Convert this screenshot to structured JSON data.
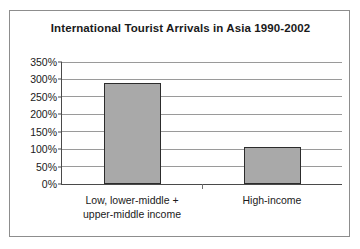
{
  "chart_data": {
    "type": "bar",
    "title": "International Tourist Arrivals in Asia 1990-2002",
    "xlabel": "",
    "ylabel": "",
    "categories": [
      "Low, lower-middle + upper-middle income",
      "High-income"
    ],
    "category_lines": [
      [
        "Low, lower-middle +",
        "upper-middle income"
      ],
      [
        "High-income"
      ]
    ],
    "values": [
      290,
      105
    ],
    "value_labels": [
      "290%",
      "105%"
    ],
    "ylim": [
      0,
      350
    ],
    "ytick_values": [
      0,
      50,
      100,
      150,
      200,
      250,
      300,
      350
    ],
    "ytick_labels": [
      "0%",
      "50%",
      "100%",
      "150%",
      "200%",
      "250%",
      "300%",
      "350%"
    ],
    "grid": true,
    "legend": false,
    "bar_fill_color": "#a9a9a9",
    "bar_border_color": "#2c2c2c",
    "gridline_color": "#9a9a9a",
    "axis_color": "#4a4a4a",
    "frame_color": "#8d8d8d",
    "background_color": "#ffffff",
    "text_color": "#1a1a1a"
  }
}
